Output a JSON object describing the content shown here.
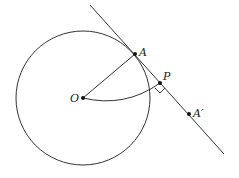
{
  "diagram": {
    "type": "geometry",
    "colors": {
      "stroke": "#333333",
      "point": "#111111",
      "background": "#ffffff"
    },
    "circle": {
      "center": "O",
      "cx": 83,
      "cy": 98,
      "r": 67
    },
    "points": [
      {
        "id": "O",
        "label": "O",
        "x": 83,
        "y": 98
      },
      {
        "id": "A",
        "label": "A",
        "x": 135,
        "y": 54
      },
      {
        "id": "P",
        "label": "P",
        "x": 160,
        "y": 83
      },
      {
        "id": "A_prime",
        "label": "A′",
        "x": 189,
        "y": 114
      }
    ],
    "segments": [
      {
        "from": "O",
        "to": "A"
      }
    ],
    "tangent_line": {
      "x1": 90,
      "y1": 5,
      "x2": 224,
      "y2": 154
    },
    "arc": {
      "from": "O",
      "to": "P"
    },
    "right_angle_marker": {
      "at": "P"
    }
  }
}
